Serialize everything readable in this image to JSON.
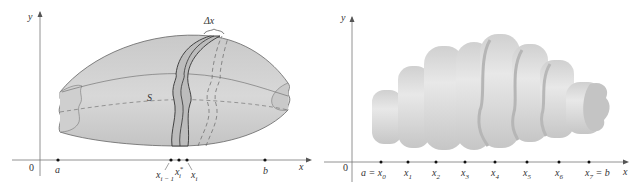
{
  "figures": [
    {
      "id": "left",
      "description": "Solid S with a thin slab of width Delta x between x_{i-1} and x_i",
      "axes": {
        "x_label": "x",
        "y_label": "y",
        "origin_label": "0"
      },
      "solid_label": "S",
      "slab_label": "Δx",
      "tick_labels": {
        "a": "a",
        "xi_minus_1": "x",
        "xi_minus_1_sub": "i − 1",
        "xi_star": "x",
        "xi_star_sub": "i",
        "xi_star_sup": "*",
        "xi": "x",
        "xi_sub": "i",
        "b": "b"
      }
    },
    {
      "id": "right",
      "description": "Solid approximated by cylindrical slabs over a subdivision x0..x7",
      "axes": {
        "x_label": "x",
        "y_label": "y",
        "origin_label": "0"
      },
      "tick_labels": [
        {
          "main": "a = x",
          "sub": "0"
        },
        {
          "main": "x",
          "sub": "1"
        },
        {
          "main": "x",
          "sub": "2"
        },
        {
          "main": "x",
          "sub": "3"
        },
        {
          "main": "x",
          "sub": "4"
        },
        {
          "main": "x",
          "sub": "5"
        },
        {
          "main": "x",
          "sub": "6"
        },
        {
          "main": "x",
          "sub": "7",
          "suffix": " = b"
        }
      ]
    }
  ],
  "colors": {
    "solid_fill": "#d4d4d4",
    "solid_dark": "#bdbdbd",
    "slab_fill": "#b8b8b8",
    "outline": "#555555",
    "axis": "#666666",
    "slab_light": "#e6e6e6"
  }
}
